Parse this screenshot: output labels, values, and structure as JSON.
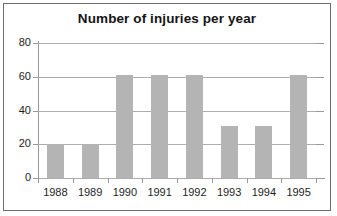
{
  "chart_data": {
    "type": "bar",
    "title": "Number of injuries per year",
    "xlabel": "",
    "ylabel": "",
    "categories": [
      "1988",
      "1989",
      "1990",
      "1991",
      "1992",
      "1993",
      "1994",
      "1995"
    ],
    "values": [
      20,
      20,
      61,
      61,
      61,
      31,
      31,
      61
    ],
    "series": [
      {
        "name": "Injuries",
        "values": [
          20,
          20,
          61,
          61,
          61,
          31,
          31,
          61
        ]
      }
    ],
    "ylim": [
      0,
      80
    ],
    "yticks": [
      0,
      20,
      40,
      60,
      80
    ],
    "ytick_labels": [
      "0",
      "20",
      "40",
      "60",
      "80"
    ],
    "grid": true,
    "grid_axis": "y",
    "legend": false,
    "legend_position": "none",
    "bar_color": "#b4b4b4",
    "background_color": "#ffffff",
    "axis_color": "#9a9a9a",
    "grid_color": "#adadad",
    "text_color": "#1d1d1d",
    "frame_color": "#6e6e6e"
  }
}
